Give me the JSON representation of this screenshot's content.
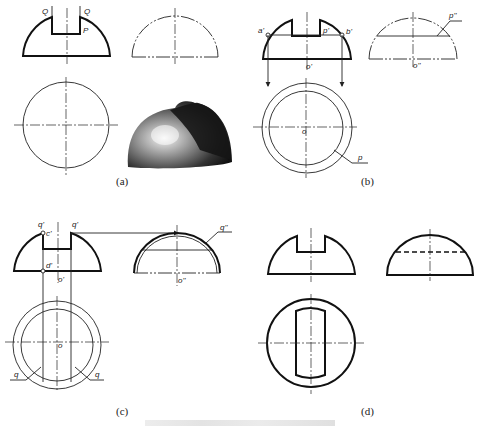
{
  "figure": {
    "panels": [
      {
        "id": "a",
        "caption": "(a)",
        "labels": {
          "q_left": "Q",
          "q_right": "Q",
          "p": "P"
        }
      },
      {
        "id": "b",
        "caption": "(b)",
        "labels": {
          "a1": "a'",
          "b1": "b'",
          "p1": "p'",
          "o1": "o'",
          "p2": "p''",
          "o2": "o''",
          "o": "o",
          "p": "p"
        }
      },
      {
        "id": "c",
        "caption": "(c)",
        "labels": {
          "q1_left": "q'",
          "q1_right": "q'",
          "c1": "c'",
          "d1": "d'",
          "o1": "o'",
          "q2": "q''",
          "o2": "o''",
          "o": "o",
          "q_left": "q",
          "q_right": "q"
        }
      },
      {
        "id": "d",
        "caption": "(d)"
      }
    ],
    "figure_caption_bar": "",
    "colors": {
      "line": "#111111",
      "background": "#ffffff"
    }
  }
}
